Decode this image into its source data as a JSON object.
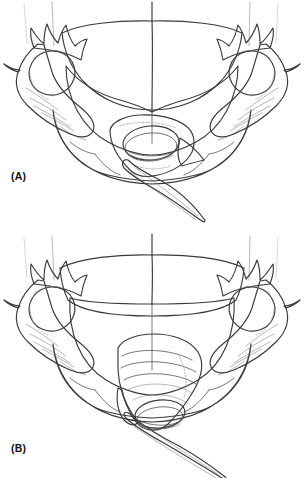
{
  "figure": {
    "background_color": "#ffffff",
    "width": 305,
    "height": 478,
    "style": "grayscale scientific line drawing with stippled shading"
  },
  "panels": [
    {
      "id": "A",
      "label": "(A)",
      "caption_position": "lower-left",
      "description": "Ventral aspect showing paired lateral appendages with spined distal pads, broad shield-like central plates, segmented arched posterior rim, and a central orifice bearing a short tapering spine directed ventro-laterally."
    },
    {
      "id": "B",
      "label": "(B)",
      "caption_position": "lower-left",
      "description": "Same structure with the central conical organ fully everted and elongated, its tapering terminal spine extending well beyond the posterior rim."
    }
  ],
  "colors": {
    "outline": "#3a3a3a",
    "outline_thin": "#4a4a4a",
    "hairline": "#6d6d6d",
    "dashed_detail": "#8a8a8a",
    "seta": "#9a9a9a",
    "plate_light": "#f4f4f4",
    "plate_mid": "#e8e8e8",
    "plate_shade": "#dcdcdc",
    "rim_band": "#bdbdbd",
    "limb_body": "#cfcfcf",
    "limb_pad": "#a6a6a6",
    "organ_light": "#d4d4d4",
    "organ_mid": "#c2c2c2",
    "organ_dark": "#ababab",
    "spine": "#c8c8c8",
    "label_text": "#111111",
    "background": "#ffffff"
  },
  "parts": {
    "left_appendage": "left-appendage",
    "right_appendage": "right-appendage",
    "left_pad": "left-distal-pad",
    "right_pad": "right-distal-pad",
    "upper_plate": "upper-shield-plate",
    "mid_plate": "middle-shield-plate",
    "posterior_rim": "posterior-segmented-rim",
    "central_organ": "central-eversible-organ",
    "terminal_spine": "terminal-spine",
    "midline": "sagittal-midline",
    "setae": "marginal-setae"
  }
}
